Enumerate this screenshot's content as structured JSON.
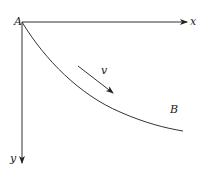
{
  "diagram": {
    "labels": {
      "origin": "A",
      "x_axis": "x",
      "y_axis": "y",
      "velocity": "v",
      "end_point": "B"
    },
    "colors": {
      "line": "#333333",
      "background": "#ffffff"
    },
    "geometry": {
      "origin": [
        22,
        22
      ],
      "x_axis_end": [
        188,
        22
      ],
      "y_axis_end": [
        22,
        164
      ],
      "curve_end": [
        183,
        131
      ],
      "velocity_arrow_start": [
        78,
        66
      ],
      "velocity_arrow_end": [
        114,
        94
      ]
    }
  }
}
